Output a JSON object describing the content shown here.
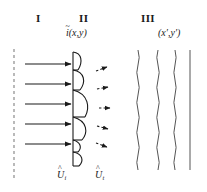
{
  "figure": {
    "width": 207,
    "height": 192,
    "background": "#ffffff",
    "stroke_color": "#1a1a1a",
    "dashed_color": "#8c8c8c",
    "wave_color": "#555555"
  },
  "region_labels": [
    {
      "name": "region-one",
      "text": "I",
      "x": 36,
      "y": 13
    },
    {
      "name": "region-two",
      "text": "II",
      "x": 79,
      "y": 13
    },
    {
      "name": "region-three",
      "text": "III",
      "x": 141,
      "y": 13
    }
  ],
  "field_labels": [
    {
      "name": "input-field-label",
      "base": "i",
      "accent": "~",
      "args": "(x,y)",
      "x": 66,
      "y": 28
    },
    {
      "name": "output-coordinate-label",
      "text": "(x′,y′)",
      "x": 158,
      "y": 28
    }
  ],
  "bottom_labels": [
    {
      "name": "incident-velocity-label",
      "base": "U",
      "accent": "^",
      "sub": "i",
      "x": 57,
      "y": 172
    },
    {
      "name": "transmitted-velocity-label",
      "base": "U",
      "accent": "^",
      "sub": "t",
      "x": 95,
      "y": 172
    }
  ],
  "geometry": {
    "source_dashed_line": {
      "x": 14,
      "y1": 49,
      "y2": 181
    },
    "incident_arrows": {
      "count": 5,
      "x_start": 25,
      "x_end": 73,
      "ys": [
        64,
        84,
        104,
        124,
        144
      ]
    },
    "aperture_line": {
      "x": 73,
      "y1": 52,
      "y2": 165
    },
    "lens_arcs": [
      {
        "y_top": 52,
        "y_bottom": 70,
        "bulge": 9
      },
      {
        "y_top": 70,
        "y_bottom": 90,
        "bulge": 11
      },
      {
        "y_top": 90,
        "y_bottom": 117,
        "bulge": 15
      },
      {
        "y_top": 117,
        "y_bottom": 140,
        "bulge": 13
      },
      {
        "y_top": 140,
        "y_bottom": 152,
        "bulge": 7
      },
      {
        "y_top": 152,
        "y_bottom": 166,
        "bulge": 8
      }
    ],
    "diffracted_arrows": {
      "count": 5,
      "items": [
        {
          "x1": 96,
          "y1": 71,
          "x2": 110,
          "y2": 66
        },
        {
          "x1": 97,
          "y1": 89,
          "x2": 111,
          "y2": 86
        },
        {
          "x1": 99,
          "y1": 108,
          "x2": 113,
          "y2": 108
        },
        {
          "x1": 97,
          "y1": 126,
          "x2": 111,
          "y2": 130
        },
        {
          "x1": 96,
          "y1": 144,
          "x2": 110,
          "y2": 149
        }
      ]
    },
    "wavefronts": [
      {
        "x": 138,
        "y1": 50,
        "y2": 170,
        "wavy": true
      },
      {
        "x": 158,
        "y1": 50,
        "y2": 170,
        "wavy": true
      },
      {
        "x": 175,
        "y1": 50,
        "y2": 170,
        "wavy": true
      },
      {
        "x": 190,
        "y1": 50,
        "y2": 170,
        "wavy": false
      }
    ]
  }
}
